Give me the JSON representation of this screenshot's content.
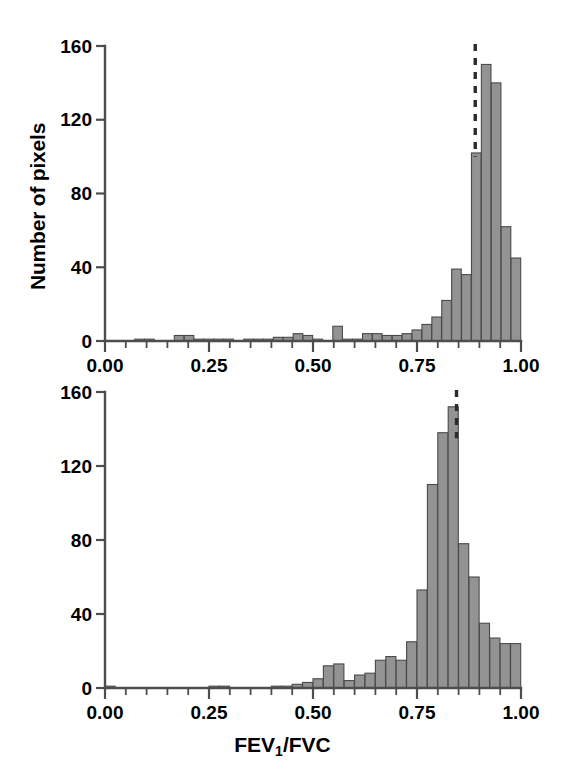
{
  "figure": {
    "background_color": "#ffffff",
    "bar_fill_color": "#939393",
    "bar_edge_color": "#4a4a4a",
    "axis_color": "#4d4d4d",
    "cutoff_color": "#2b2b2b"
  },
  "labels": {
    "ylabel_top": "Number of pixels",
    "ylabel_bottom": "Number of pixels",
    "xlabel": "FEV",
    "xlabel_sub": "1",
    "xlabel_rest": "/FVC"
  },
  "axis": {
    "yticks": [
      0,
      40,
      80,
      120,
      160
    ],
    "ytick_labels": [
      "0",
      "40",
      "80",
      "120",
      "160"
    ],
    "xticks": [
      0.0,
      0.25,
      0.5,
      0.75,
      1.0
    ],
    "xtick_labels": [
      "0.00",
      "0.25",
      "0.50",
      "0.75",
      "1.00"
    ],
    "xminor_step": 0.05,
    "ylim": [
      0,
      160
    ],
    "xlim": [
      0.0,
      1.0
    ]
  },
  "chart_data": [
    {
      "type": "bar",
      "id": "top-histogram",
      "title": "",
      "xlabel": "FEV1/FVC",
      "ylabel": "Number of pixels",
      "xlim": [
        0.0,
        1.0
      ],
      "ylim": [
        0,
        160
      ],
      "grid": false,
      "legend": "none",
      "bin_width": 0.025,
      "bin_starts": [
        0.0,
        0.025,
        0.05,
        0.075,
        0.1,
        0.125,
        0.15,
        0.175,
        0.2,
        0.225,
        0.25,
        0.275,
        0.3,
        0.325,
        0.35,
        0.375,
        0.4,
        0.425,
        0.45,
        0.475,
        0.5,
        0.525,
        0.55,
        0.575,
        0.6,
        0.625,
        0.65,
        0.675,
        0.7,
        0.725,
        0.75,
        0.775,
        0.8,
        0.825,
        0.85,
        0.875,
        0.9,
        0.925,
        0.95,
        0.975
      ],
      "values": [
        0,
        0,
        0,
        1,
        1,
        0,
        0,
        3,
        3,
        1,
        1,
        1,
        1,
        0,
        1,
        1,
        1,
        2,
        2,
        4,
        3,
        1,
        0,
        8,
        1,
        1,
        4,
        4,
        3,
        3,
        4,
        6,
        9,
        13,
        22,
        39,
        36,
        102,
        150,
        140
      ],
      "extra_last_bins": [
        62,
        45
      ],
      "annotations": [
        {
          "type": "vline",
          "style": "dashed",
          "x": 0.89,
          "label": "cutoff"
        }
      ]
    },
    {
      "type": "bar",
      "id": "bottom-histogram",
      "title": "",
      "xlabel": "FEV1/FVC",
      "ylabel": "Number of pixels",
      "xlim": [
        0.0,
        1.0
      ],
      "ylim": [
        0,
        160
      ],
      "grid": false,
      "legend": "none",
      "bin_width": 0.025,
      "bin_starts": [
        0.0,
        0.025,
        0.05,
        0.075,
        0.1,
        0.125,
        0.15,
        0.175,
        0.2,
        0.225,
        0.25,
        0.275,
        0.3,
        0.325,
        0.35,
        0.375,
        0.4,
        0.425,
        0.45,
        0.475,
        0.5,
        0.525,
        0.55,
        0.575,
        0.6,
        0.625,
        0.65,
        0.675,
        0.7,
        0.725,
        0.75,
        0.775,
        0.8,
        0.825,
        0.85,
        0.875,
        0.9,
        0.925,
        0.95,
        0.975
      ],
      "values": [
        1,
        0,
        0,
        0,
        0,
        0,
        0,
        0,
        0,
        0,
        1,
        1,
        0,
        0,
        0,
        0,
        1,
        1,
        2,
        3,
        5,
        12,
        13,
        4,
        7,
        8,
        15,
        17,
        15,
        25,
        53,
        110,
        138,
        152,
        78,
        60,
        35,
        27,
        24,
        24
      ],
      "annotations": [
        {
          "type": "vline",
          "style": "dashed",
          "x": 0.845,
          "label": "cutoff"
        }
      ]
    }
  ]
}
